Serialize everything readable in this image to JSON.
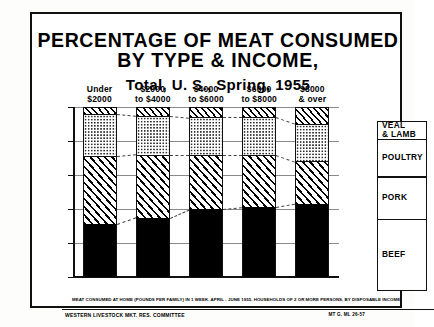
{
  "title": {
    "line1": "PERCENTAGE OF MEAT CONSUMED",
    "line2": "BY TYPE & INCOME,",
    "subtitle": "Total, U. S., Spring, 1955"
  },
  "footnote": "MEAT CONSUMED AT HOME (POUNDS PER FAMILY) IN 1 WEEK, APRIL - JUNE 1955, HOUSEHOLDS OF 2 OR MORE PERSONS, BY DISPOSABLE INCOME.",
  "credit": "WESTERN LIVESTOCK MKT. RES. COMMITTEE",
  "code": "MT G. ML 26-57",
  "legend": {
    "items": [
      {
        "label": "VEAL\n& LAMB",
        "label_line1": "VEAL",
        "label_line2": "& LAMB",
        "pattern": "diagonal-hatch"
      },
      {
        "label": "POULTRY",
        "label_line1": "POULTRY",
        "label_line2": "",
        "pattern": "dotted"
      },
      {
        "label": "PORK",
        "label_line1": "PORK",
        "label_line2": "",
        "pattern": "diagonal-hatch-wide"
      },
      {
        "label": "BEEF",
        "label_line1": "BEEF",
        "label_line2": "",
        "pattern": "solid-black"
      }
    ]
  },
  "chart_data": {
    "type": "bar",
    "title": "PERCENTAGE OF MEAT CONSUMED BY TYPE & INCOME, Total, U. S., Spring, 1955",
    "xlabel": "",
    "ylabel": "",
    "ylim": [
      0,
      100
    ],
    "grid": true,
    "stacked": true,
    "legend_position": "right",
    "categories": [
      "Under $2000",
      "$2000 to $4000",
      "$4000 to $6000",
      "$6000 to $8000",
      "$8000 & over"
    ],
    "category_labels": [
      {
        "line1": "Under",
        "line2": "$2000"
      },
      {
        "line1": "$2000",
        "line2": "to $4000"
      },
      {
        "line1": "$4000",
        "line2": "to $6000"
      },
      {
        "line1": "$6000",
        "line2": "to $8000"
      },
      {
        "line1": "$8000",
        "line2": "& over"
      }
    ],
    "ytick_labels": [
      "0 %",
      "20 %",
      "40 %",
      "60 %",
      "80 %",
      "100 %"
    ],
    "ytick_values": [
      0,
      20,
      40,
      60,
      80,
      100
    ],
    "series": [
      {
        "name": "BEEF",
        "values": [
          31,
          35,
          40,
          41,
          43
        ]
      },
      {
        "name": "PORK",
        "values": [
          40,
          37,
          32,
          31,
          25
        ]
      },
      {
        "name": "POULTRY",
        "values": [
          25,
          23,
          22,
          22,
          22
        ]
      },
      {
        "name": "VEAL & LAMB",
        "values": [
          4,
          5,
          6,
          6,
          10
        ]
      }
    ],
    "cumulative_tops": [
      {
        "beef": 31,
        "pork": 71,
        "poultry": 96,
        "veal": 100
      },
      {
        "beef": 35,
        "pork": 72,
        "poultry": 95,
        "veal": 100
      },
      {
        "beef": 40,
        "pork": 72,
        "poultry": 94,
        "veal": 100
      },
      {
        "beef": 41,
        "pork": 72,
        "poultry": 94,
        "veal": 100
      },
      {
        "beef": 43,
        "pork": 68,
        "poultry": 90,
        "veal": 100
      }
    ]
  }
}
